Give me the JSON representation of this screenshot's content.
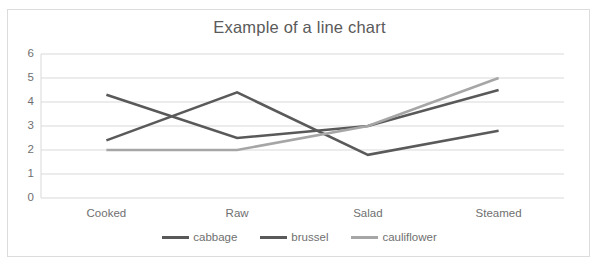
{
  "chart_data": {
    "type": "line",
    "title": "Example of a line chart",
    "xlabel": "",
    "ylabel": "",
    "categories": [
      "Cooked",
      "Raw",
      "Salad",
      "Steamed"
    ],
    "yticks": [
      "0",
      "1",
      "2",
      "3",
      "4",
      "5",
      "6"
    ],
    "ylim": [
      0,
      6
    ],
    "grid": true,
    "legend_position": "bottom",
    "series": [
      {
        "name": "cabbage",
        "color": "#595959",
        "values": [
          4.3,
          2.5,
          3.0,
          4.5
        ]
      },
      {
        "name": "brussel",
        "color": "#5a5a5a",
        "values": [
          2.4,
          4.4,
          1.8,
          2.8
        ]
      },
      {
        "name": "cauliflower",
        "color": "#a6a6a6",
        "values": [
          2.0,
          2.0,
          3.0,
          5.0
        ]
      }
    ]
  },
  "frame": {
    "border_color": "#dcdcdc",
    "background": "#ffffff",
    "gridline_color": "#d9d9d9",
    "text_color": "#6f6f6f"
  }
}
